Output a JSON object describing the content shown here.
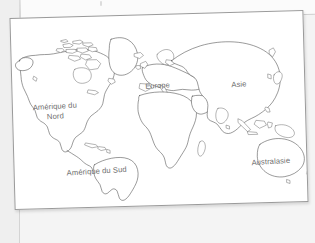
{
  "scene": {
    "title": "World map worksheet",
    "background_color": "#efefef",
    "paper_color": "#ffffff",
    "paper_border_color": "#9a9a9a",
    "ink_color": "#4a4a4a",
    "label_color": "#6d6d6d"
  },
  "map": {
    "type": "world-outline-map",
    "projection_hint": "equirectangular-ish outline, no graticule, no fills",
    "rotation_degrees": -1.55,
    "labels": [
      {
        "id": "north-america",
        "text": "Amérique du\nNord",
        "line1": "Amérique du",
        "line2": "Nord"
      },
      {
        "id": "south-america",
        "text": "Amérique du Sud"
      },
      {
        "id": "europe",
        "text": "Europe"
      },
      {
        "id": "asia",
        "text": "Asie"
      },
      {
        "id": "australasia",
        "text": "Australasie"
      }
    ]
  },
  "under_sheet": {
    "visible": true,
    "description": "second sheet of paper visible behind top edge"
  }
}
